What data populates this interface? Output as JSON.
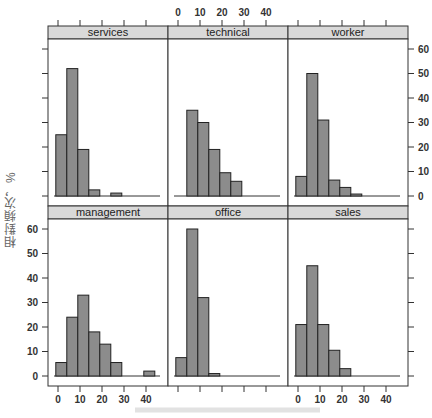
{
  "chart_data": {
    "type": "bar",
    "subtype": "lattice-histogram",
    "title": "",
    "xlabel": "",
    "ylabel": "相對頻次，%",
    "layout": {
      "rows": 2,
      "cols": 3,
      "grid": false,
      "strip_color": "#d9d9d9"
    },
    "xlim": [
      -3,
      47
    ],
    "ylim": [
      -4,
      65
    ],
    "x_ticks": [
      0,
      10,
      20,
      30,
      40
    ],
    "y_ticks": [
      0,
      10,
      20,
      30,
      40,
      50,
      60
    ],
    "bin_start": -1,
    "bin_width": 5,
    "bar_color": "#8c8c8c",
    "panels": [
      {
        "name": "services",
        "row": 0,
        "col": 0,
        "values": [
          25,
          52,
          19,
          2.5,
          0,
          1.2
        ]
      },
      {
        "name": "technical",
        "row": 0,
        "col": 1,
        "values": [
          0,
          35,
          30,
          19,
          9.5,
          6
        ]
      },
      {
        "name": "worker",
        "row": 0,
        "col": 2,
        "values": [
          8,
          50,
          31,
          6.5,
          3.5,
          0.8
        ]
      },
      {
        "name": "management",
        "row": 1,
        "col": 0,
        "values": [
          5.5,
          24,
          33,
          18,
          13,
          5.5,
          0,
          0,
          2
        ]
      },
      {
        "name": "office",
        "row": 1,
        "col": 1,
        "values": [
          7.5,
          60,
          32,
          1
        ]
      },
      {
        "name": "sales",
        "row": 1,
        "col": 2,
        "values": [
          21,
          45,
          21,
          10.5,
          3
        ]
      }
    ]
  },
  "labels": {
    "ylabel": "相對頻次，%",
    "xlabel_faint": "────────────────────"
  }
}
